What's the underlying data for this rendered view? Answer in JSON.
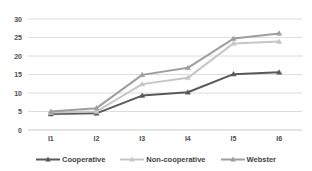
{
  "chart_data": {
    "type": "line",
    "categories": [
      "I1",
      "I2",
      "I3",
      "I4",
      "I5",
      "I6"
    ],
    "series": [
      {
        "name": "Cooperative",
        "color": "#595959",
        "values": [
          4.3,
          4.5,
          9.3,
          10.2,
          15.1,
          15.6
        ]
      },
      {
        "name": "Non-cooperative",
        "color": "#c6c6c6",
        "values": [
          4.7,
          5.0,
          12.4,
          14.1,
          23.4,
          23.9
        ]
      },
      {
        "name": "Webster",
        "color": "#9e9e9e",
        "values": [
          5.0,
          5.9,
          14.9,
          16.8,
          24.7,
          26.1
        ]
      }
    ],
    "title": "",
    "xlabel": "",
    "ylabel": "",
    "ylim": [
      0,
      30
    ],
    "ytick_step": 5,
    "grid": true,
    "gridline_color": "#dcdcdc",
    "baseline_color": "#c9c9c9",
    "marker": "triangle",
    "legend_position": "bottom"
  }
}
